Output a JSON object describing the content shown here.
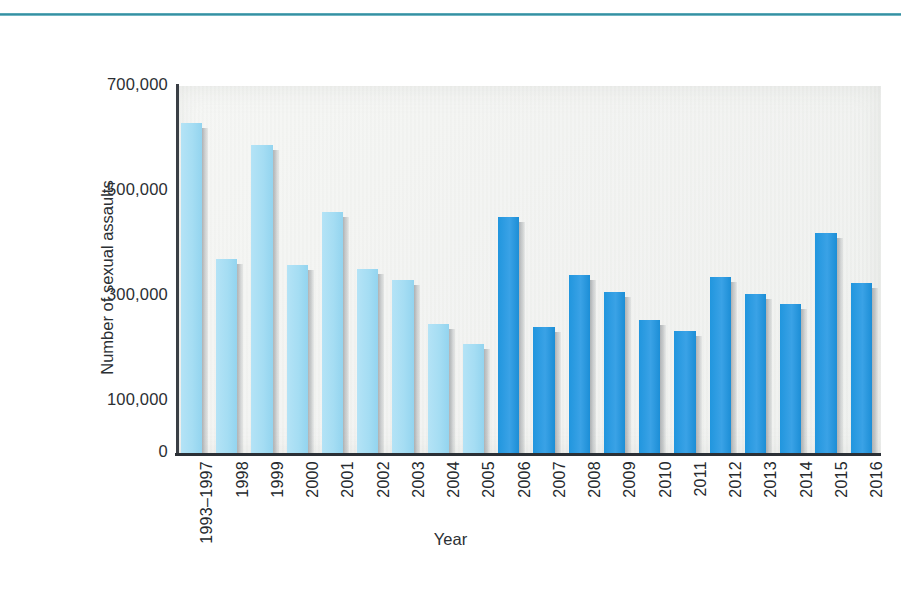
{
  "chart_data": {
    "type": "bar",
    "title": "",
    "xlabel": "Year",
    "ylabel": "Number of sexual assaults",
    "categories": [
      "1993–1997",
      "1998",
      "1999",
      "2000",
      "2001",
      "2002",
      "2003",
      "2004",
      "2005",
      "2006",
      "2007",
      "2008",
      "2009",
      "2010",
      "2011",
      "2012",
      "2013",
      "2014",
      "2015",
      "2016"
    ],
    "values": [
      630000,
      371000,
      588000,
      359000,
      460000,
      351000,
      330000,
      247000,
      208000,
      450000,
      240000,
      339000,
      308000,
      253000,
      233000,
      335000,
      303000,
      285000,
      419000,
      325000
    ],
    "ylim": [
      0,
      700000
    ],
    "yticks": [
      0,
      100000,
      300000,
      500000,
      700000
    ],
    "ytick_labels": [
      "0",
      "100,000",
      "300,000",
      "500,000",
      "700,000"
    ],
    "grid": false,
    "legend": "none",
    "series_colors": {
      "early_period": "#A5DDF3",
      "later_period": "#2196DE"
    },
    "color_split_index": 9,
    "plot_background": "#f1f2f0",
    "accent_rule_color": "#2e8a9c"
  }
}
